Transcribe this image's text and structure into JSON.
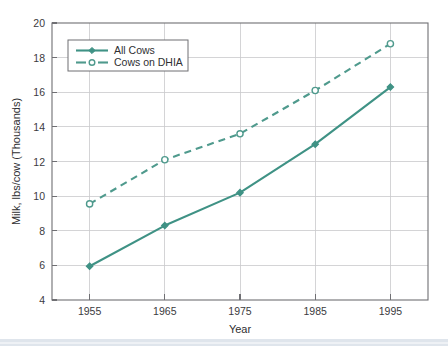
{
  "chart_data": {
    "type": "line",
    "title": "",
    "xlabel": "Year",
    "ylabel": "Milk, lbs/cow (Thousands)",
    "x": [
      1955,
      1965,
      1975,
      1985,
      1995
    ],
    "xtick_labels": [
      "1955",
      "1965",
      "1975",
      "1985",
      "1995"
    ],
    "ytick_labels": [
      "4",
      "6",
      "8",
      "10",
      "12",
      "14",
      "16",
      "18",
      "20"
    ],
    "yticks": [
      4,
      6,
      8,
      10,
      12,
      14,
      16,
      18,
      20
    ],
    "xlim": [
      1950,
      2000
    ],
    "ylim": [
      4,
      20
    ],
    "grid": true,
    "legend_position": "upper-left",
    "series": [
      {
        "name": "All Cows",
        "values": [
          5.95,
          8.3,
          10.2,
          13.0,
          16.3
        ],
        "style": "solid",
        "marker": "filled-diamond",
        "color": "#3f9285"
      },
      {
        "name": "Cows on DHIA",
        "values": [
          9.55,
          12.1,
          13.6,
          16.1,
          18.8
        ],
        "style": "dashed",
        "marker": "open-circle",
        "color": "#4f9a8d"
      }
    ]
  },
  "legend": {
    "entries": [
      {
        "label": "All Cows"
      },
      {
        "label": "Cows on DHIA"
      }
    ]
  },
  "axes": {
    "x_title": "Year",
    "y_title": "Milk, lbs/cow (Thousands)",
    "y_tick_0": "4",
    "y_tick_1": "6",
    "y_tick_2": "8",
    "y_tick_3": "10",
    "y_tick_4": "12",
    "y_tick_5": "14",
    "y_tick_6": "16",
    "y_tick_7": "18",
    "y_tick_8": "20",
    "x_tick_0": "1955",
    "x_tick_1": "1965",
    "x_tick_2": "1975",
    "x_tick_3": "1985",
    "x_tick_4": "1995"
  },
  "colors": {
    "series": "#3f9285",
    "grid": "#c9c9cc",
    "axis": "#6f6f73",
    "band": "#dfe5ec",
    "background": "#ffffff"
  }
}
